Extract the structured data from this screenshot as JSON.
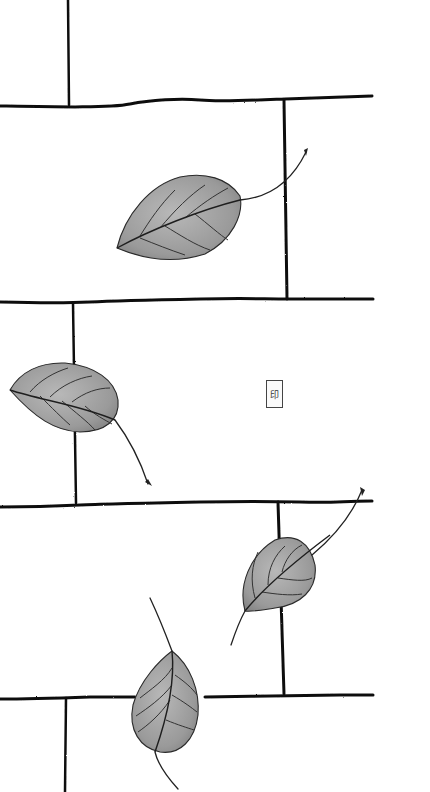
{
  "artwork": {
    "subject": "Falling leaves over ink-drawn brick wall",
    "background_color": "#ffffff",
    "ink_color": "#111111",
    "leaf_fill": "#9a9a9a",
    "leaf_fill_light": "#b8b8b8"
  },
  "brick_lines": {
    "horizontal": [
      {
        "d": "M0,106 C60,107 110,108 130,104 S180,98 200,100 S260,100 285,99 S340,97 372,96",
        "w": 3
      },
      {
        "d": "M0,302 C40,303 70,303 90,302 S150,300 200,299 S260,299 290,299 S340,299 373,299",
        "w": 3
      },
      {
        "d": "M0,507 C40,507 60,506 80,505 S150,503 200,502 S260,501 300,502 S340,501 372,501",
        "w": 3
      },
      {
        "d": "M0,699 C30,699 60,698 90,697 L135,697 M205,697 C250,696 300,696 340,695 L373,695",
        "w": 3
      }
    ],
    "vertical": [
      {
        "d": "M68,0 L69,105",
        "w": 2.5
      },
      {
        "d": "M284,100 L287,299",
        "w": 3
      },
      {
        "d": "M73,303 L76,503",
        "w": 2.5
      },
      {
        "d": "M278,502 L284,694",
        "w": 3
      },
      {
        "d": "M66,698 L65,792",
        "w": 2.5
      }
    ]
  },
  "leaves": [
    {
      "name": "leaf-top",
      "body": "M117,248 C125,215 150,185 180,177 C205,172 228,178 240,196 C244,215 232,240 205,254 C180,262 150,262 117,248 Z",
      "midrib": "M117,248 C150,230 200,210 240,200",
      "veins": [
        "M140,236 C150,220 160,205 175,190",
        "M160,228 C175,210 190,195 205,185",
        "M185,218 C200,205 215,195 228,188",
        "M165,226 C180,235 195,245 210,250",
        "M195,214 C208,224 220,235 228,240",
        "M140,238 C155,244 170,250 185,255"
      ],
      "stem": "M240,200 C265,198 290,185 306,152",
      "stem_tip": "M304,150 L308,148 L306,156 Z"
    },
    {
      "name": "leaf-middle-left",
      "body": "M10,390 C20,372 40,362 65,363 C95,366 115,380 118,400 C120,420 105,432 80,432 C55,431 35,418 10,390 Z",
      "midrib": "M10,390 C40,400 80,405 115,420",
      "veins": [
        "M30,392 C40,380 55,372 68,368",
        "M50,397 C62,385 78,378 92,376",
        "M72,402 C85,392 98,388 110,388",
        "M40,396 C52,408 62,418 70,425",
        "M62,401 C75,412 88,422 95,430",
        "M85,406 C95,415 105,420 112,424"
      ],
      "stem": "M115,420 C130,440 140,460 148,484",
      "stem_tip": "M145,482 L152,486 L148,479 Z"
    },
    {
      "name": "leaf-middle-right",
      "body": "M245,611 C238,585 250,555 275,540 C295,533 310,542 315,565 C318,590 300,605 275,608 C262,610 252,612 245,611 Z",
      "midrib": "M245,611 C270,580 310,550 330,535",
      "veins": [
        "M255,598 C250,580 252,565 258,552",
        "M268,585 C268,568 275,555 285,546",
        "M282,572 C285,560 292,550 302,545",
        "M262,592 C275,594 290,596 302,594",
        "M278,578 C292,580 305,582 312,578"
      ],
      "stem": "M312,555 C330,540 350,520 362,490",
      "stem_tip": "M360,487 L365,490 L362,496 Z",
      "tail": "M245,611 C240,620 235,633 231,645"
    },
    {
      "name": "leaf-bottom",
      "body": "M172,651 C160,660 140,680 133,705 C128,730 140,748 160,752 C180,755 195,740 198,715 C200,690 190,665 172,651 Z",
      "midrib": "M172,651 C175,680 168,715 155,752",
      "veins": [
        "M172,668 C165,680 150,690 140,698",
        "M172,685 C162,698 148,708 136,716",
        "M170,700 C160,715 148,725 138,732",
        "M175,675 C185,682 192,688 197,695",
        "M172,695 C184,702 192,708 197,712",
        "M166,720 C178,725 188,728 194,730"
      ],
      "stem": "M155,752 C158,765 168,778 178,789",
      "tail": "M172,651 C166,635 158,615 150,598"
    }
  ],
  "seal": {
    "label": "印",
    "x": 266,
    "y": 380,
    "width": 15,
    "height": 26
  }
}
